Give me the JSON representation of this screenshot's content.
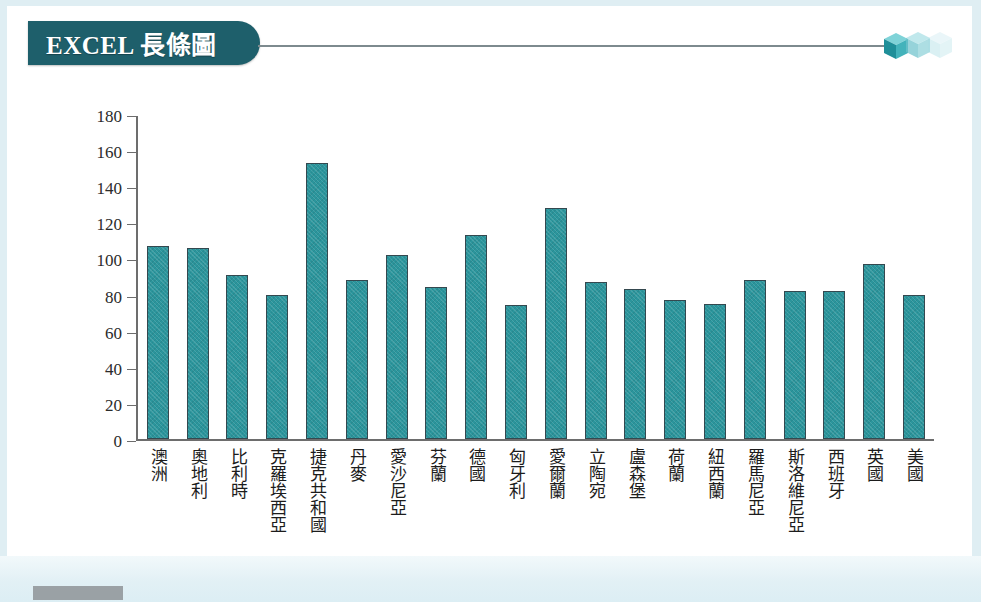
{
  "slide": {
    "title": "EXCEL 長條圖",
    "decoration": "three-cubes-icon",
    "corner_tab": "footer-tab"
  },
  "chart_data": {
    "type": "bar",
    "title": "EXCEL 長條圖",
    "xlabel": "",
    "ylabel": "",
    "ylim": [
      0,
      180
    ],
    "ytick_step": 20,
    "yticks": [
      180,
      160,
      140,
      120,
      100,
      80,
      60,
      40,
      20,
      0
    ],
    "grid": false,
    "legend": "none",
    "bar_color": "#2b959c",
    "bar_border_color": "#34484f",
    "categories": [
      "澳洲",
      "奧地利",
      "比利時",
      "克羅埃西亞",
      "捷克共和國",
      "丹麥",
      "愛沙尼亞",
      "芬蘭",
      "德國",
      "匈牙利",
      "愛爾蘭",
      "立陶宛",
      "盧森堡",
      "荷蘭",
      "紐西蘭",
      "羅馬尼亞",
      "斯洛維尼亞",
      "西班牙",
      "英國",
      "美國"
    ],
    "values": [
      107,
      106,
      91,
      80,
      153,
      88,
      102,
      84,
      113,
      74,
      128,
      87,
      83,
      77,
      75,
      88,
      82,
      82,
      97,
      80
    ]
  }
}
